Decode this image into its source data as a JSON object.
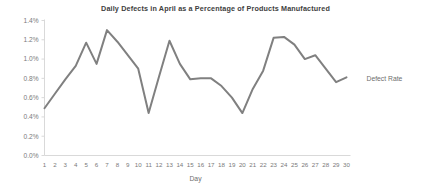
{
  "chart_data": {
    "type": "line",
    "title": "Daily Defects in April as a Percentage of Products Manufactured",
    "xlabel": "Day",
    "ylabel": "",
    "grid": false,
    "legend_position": "right",
    "line_color": "#808080",
    "x": [
      1,
      2,
      3,
      4,
      5,
      6,
      7,
      8,
      9,
      10,
      11,
      12,
      13,
      14,
      15,
      16,
      17,
      18,
      19,
      20,
      21,
      22,
      23,
      24,
      25,
      26,
      27,
      28,
      29,
      30
    ],
    "categories": [
      "1",
      "2",
      "3",
      "4",
      "5",
      "6",
      "7",
      "8",
      "9",
      "10",
      "11",
      "12",
      "13",
      "14",
      "15",
      "16",
      "17",
      "18",
      "19",
      "20",
      "21",
      "22",
      "23",
      "24",
      "25",
      "26",
      "27",
      "28",
      "29",
      "30"
    ],
    "series": [
      {
        "name": "Defect Rate",
        "values": [
          0.49,
          0.64,
          0.79,
          0.93,
          1.17,
          0.95,
          1.3,
          1.18,
          1.04,
          0.9,
          0.44,
          0.82,
          1.19,
          0.95,
          0.79,
          0.8,
          0.8,
          0.72,
          0.6,
          0.44,
          0.69,
          0.88,
          1.22,
          1.23,
          1.15,
          1.0,
          1.04,
          0.9,
          0.76,
          0.81
        ]
      }
    ],
    "ylim": [
      0.0,
      1.4
    ],
    "yticks": [
      0.0,
      0.2,
      0.4,
      0.6,
      0.8,
      1.0,
      1.2,
      1.4
    ],
    "ytick_labels": [
      "0.0%",
      "0.2%",
      "0.4%",
      "0.6%",
      "0.8%",
      "1.0%",
      "1.2%",
      "1.4%"
    ],
    "legend_entries": [
      "Defect Rate"
    ]
  }
}
